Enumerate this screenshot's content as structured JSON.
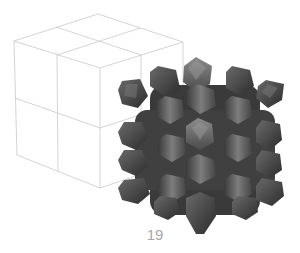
{
  "figure": {
    "number_label": "19",
    "colors": {
      "background": "#ffffff",
      "wireframe": "#c9c9c9",
      "lattice_dark": "#2f2f2f",
      "lattice_mid": "#555555",
      "lattice_light": "#8a8a8a",
      "caption": "#a8a8a8"
    },
    "wire_cube": {
      "subdivisions": 2,
      "vertices": {
        "top_back": [
          98,
          14
        ],
        "top_left": [
          14,
          41
        ],
        "top_right": [
          183,
          42
        ],
        "top_front": [
          100,
          68
        ],
        "bottom_left": [
          17,
          155
        ],
        "bottom_front": [
          100,
          188
        ],
        "bottom_right": [
          183,
          160
        ]
      }
    },
    "lattice": {
      "bounds": {
        "x_min": 118,
        "x_max": 284,
        "y_min": 57,
        "y_max": 235
      }
    }
  }
}
